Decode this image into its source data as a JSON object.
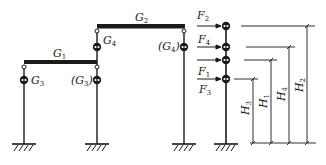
{
  "left_frame": {
    "beams": [
      {
        "id": "beam-g1",
        "label": "G",
        "sub": "1"
      },
      {
        "id": "beam-g2",
        "label": "G",
        "sub": "2"
      }
    ],
    "masses": [
      {
        "id": "mass-g3-left",
        "label": "G",
        "sub": "3",
        "paren": false
      },
      {
        "id": "mass-g3-mid",
        "label": "(G",
        "sub": "3",
        "close": ")",
        "paren": true
      },
      {
        "id": "mass-g4-mid",
        "label": "G",
        "sub": "4",
        "paren": false
      },
      {
        "id": "mass-g4-right",
        "label": "(G",
        "sub": "4",
        "close": ")",
        "paren": true
      }
    ]
  },
  "equivalent_model": {
    "forces": [
      {
        "label": "F",
        "sub": "2"
      },
      {
        "label": "F",
        "sub": "4"
      },
      {
        "label": "F",
        "sub": "1"
      },
      {
        "label": "F",
        "sub": "3"
      }
    ],
    "heights": [
      {
        "label": "H",
        "sub": "3"
      },
      {
        "label": "H",
        "sub": "1"
      },
      {
        "label": "H",
        "sub": "4"
      },
      {
        "label": "H",
        "sub": "2"
      }
    ]
  },
  "colors": {
    "line": "#1a1a1a",
    "background": "#ffffff"
  }
}
